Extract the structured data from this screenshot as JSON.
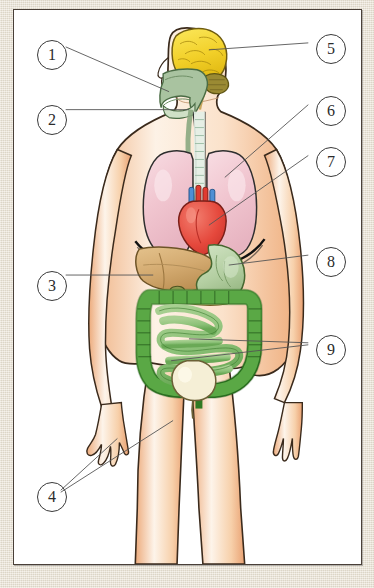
{
  "figure": {
    "type": "anatomical-illustration",
    "plate_background": "#ffffff",
    "page_background": "#e8e1d2",
    "frame_color": "#4a4038"
  },
  "callouts": [
    {
      "number": "1",
      "target": "nasal-cavity",
      "side": "left",
      "leader": "diagonal"
    },
    {
      "number": "2",
      "target": "trachea-neck",
      "side": "left",
      "leader": "horizontal"
    },
    {
      "number": "3",
      "target": "liver",
      "side": "left",
      "leader": "horizontal"
    },
    {
      "number": "4",
      "target": "skin",
      "side": "left",
      "leader": "two-lines"
    },
    {
      "number": "5",
      "target": "brain",
      "side": "right",
      "leader": "horizontal"
    },
    {
      "number": "6",
      "target": "lung",
      "side": "right",
      "leader": "diagonal"
    },
    {
      "number": "7",
      "target": "heart",
      "side": "right",
      "leader": "diagonal"
    },
    {
      "number": "8",
      "target": "stomach",
      "side": "right",
      "leader": "horizontal"
    },
    {
      "number": "9",
      "target": "intestines",
      "side": "right",
      "leader": "two-lines"
    }
  ],
  "organs": {
    "brain": {
      "label": "brain",
      "color": "#f5d833",
      "outline": "#6b5a10"
    },
    "cerebellum": {
      "label": "cerebellum",
      "color": "#9a8a33",
      "outline": "#5e5414"
    },
    "nasal_pharynx": {
      "label": "nasal cavity",
      "color": "#a9c3a0",
      "outline": "#4e6b48"
    },
    "trachea": {
      "label": "trachea",
      "color": "#dcebe2",
      "outline": "#3a3a3a"
    },
    "lung_left": {
      "label": "lung",
      "color": "#f2ccd4",
      "outline": "#2e2e2e"
    },
    "lung_right": {
      "label": "lung",
      "color": "#f2ccd4",
      "outline": "#2e2e2e"
    },
    "heart": {
      "label": "heart",
      "color": "#e8544a",
      "outline": "#7a1f18"
    },
    "vessel_artery": {
      "label": "artery",
      "color": "#e03b30",
      "outline": "#7a1f18"
    },
    "vessel_vein": {
      "label": "vein",
      "color": "#4f8fd4",
      "outline": "#1e4f84"
    },
    "diaphragm": {
      "label": "diaphragm",
      "color": "#111111",
      "outline": "#111111"
    },
    "liver": {
      "label": "liver",
      "color": "#d8b278",
      "outline": "#6d5326"
    },
    "gallbladder": {
      "label": "gallbladder",
      "color": "#8e9c52",
      "outline": "#4d5420"
    },
    "stomach": {
      "label": "stomach",
      "color": "#b6cfa6",
      "outline": "#46662f"
    },
    "pancreas": {
      "label": "pancreas",
      "color": "#e3c98f",
      "outline": "#7a6228"
    },
    "large_intestine": {
      "label": "large intestine",
      "color": "#4f9e3d",
      "outline": "#1d4a14"
    },
    "small_intestine": {
      "label": "small intestine",
      "color": "#8cc178",
      "outline": "#2e6b22"
    },
    "bladder": {
      "label": "bladder",
      "color": "#f5efd6",
      "outline": "#6b6036"
    },
    "skin": {
      "label": "skin",
      "color": "#f6c79a",
      "outline": "#4a3a2a"
    }
  },
  "body": {
    "skin_fill": "#f8cfa4",
    "skin_highlight": "#fdf3e6",
    "outline": "#3a2a1c"
  },
  "leader_line": {
    "color": "#555555",
    "width": "0.9"
  }
}
